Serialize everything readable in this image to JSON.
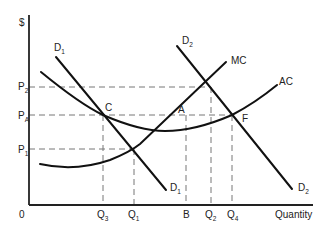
{
  "diagram": {
    "title": "",
    "y_axis_label": "$",
    "x_axis_label": "Quantity",
    "origin_label": "0",
    "price_levels": [
      {
        "name": "P",
        "sub": "2"
      },
      {
        "name": "P",
        "sub": "A"
      },
      {
        "name": "P",
        "sub": "1"
      }
    ],
    "quantity_levels": [
      {
        "name": "Q",
        "sub": "3"
      },
      {
        "name": "Q",
        "sub": "1"
      },
      {
        "name": "B",
        "sub": ""
      },
      {
        "name": "Q",
        "sub": "2"
      },
      {
        "name": "Q",
        "sub": "4"
      }
    ],
    "curves": {
      "d1_top": {
        "name": "D",
        "sub": "1"
      },
      "d1_bottom": {
        "name": "D",
        "sub": "1"
      },
      "d2_top": {
        "name": "D",
        "sub": "2"
      },
      "d2_bottom": {
        "name": "D",
        "sub": "2"
      },
      "mc": {
        "name": "MC"
      },
      "ac": {
        "name": "AC"
      }
    },
    "points": {
      "c": "C",
      "a": "A",
      "f": "F"
    }
  }
}
